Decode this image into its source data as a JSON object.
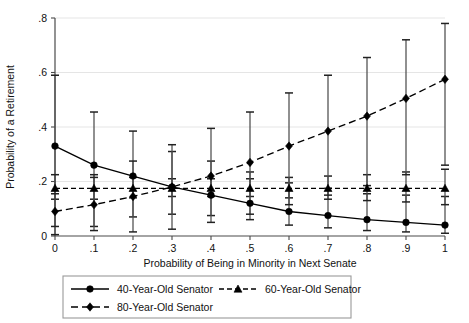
{
  "chart_data": {
    "type": "line",
    "title": "",
    "subtitle": "",
    "xlabel": "Probability of Being in Minority in Next Senate",
    "ylabel": "Probability of a Retirement",
    "x": [
      0,
      0.1,
      0.2,
      0.3,
      0.4,
      0.5,
      0.6,
      0.7,
      0.8,
      0.9,
      1
    ],
    "xtick_labels": [
      "0",
      ".1",
      ".2",
      ".3",
      ".4",
      ".5",
      ".6",
      ".7",
      ".8",
      ".9",
      "1"
    ],
    "ytick_labels": [
      "0",
      ".2",
      ".4",
      ".6",
      ".8"
    ],
    "ytick_values": [
      0,
      0.2,
      0.4,
      0.6,
      0.8
    ],
    "xlim": [
      0,
      1
    ],
    "ylim": [
      0,
      0.8
    ],
    "grid": "horizontal",
    "legend_position": "below-axes",
    "error_bars": "vertical, capped, 95% confidence interval",
    "series": [
      {
        "name": "40-Year-Old Senator",
        "marker": "circle",
        "linestyle": "solid",
        "color": "#000000",
        "values": [
          0.33,
          0.26,
          0.22,
          0.18,
          0.15,
          0.12,
          0.09,
          0.075,
          0.06,
          0.05,
          0.04
        ],
        "err_low": [
          0.005,
          0.035,
          0.07,
          0.08,
          0.075,
          0.06,
          0.04,
          0.03,
          0.02,
          0.015,
          0.01
        ],
        "err_high": [
          0.59,
          0.455,
          0.385,
          0.31,
          0.275,
          0.235,
          0.195,
          0.175,
          0.155,
          0.15,
          0.145
        ]
      },
      {
        "name": "60-Year-Old Senator",
        "marker": "triangle",
        "linestyle": "dashed",
        "color": "#000000",
        "values": [
          0.175,
          0.175,
          0.175,
          0.175,
          0.175,
          0.175,
          0.175,
          0.175,
          0.175,
          0.175,
          0.175
        ],
        "err_low": [
          0.135,
          0.135,
          0.14,
          0.145,
          0.145,
          0.145,
          0.14,
          0.135,
          0.13,
          0.125,
          0.115
        ],
        "err_high": [
          0.225,
          0.225,
          0.215,
          0.21,
          0.21,
          0.21,
          0.215,
          0.22,
          0.225,
          0.235,
          0.245
        ]
      },
      {
        "name": "80-Year-Old Senator",
        "marker": "diamond",
        "linestyle": "dash",
        "color": "#000000",
        "values": [
          0.09,
          0.115,
          0.145,
          0.18,
          0.22,
          0.27,
          0.33,
          0.385,
          0.44,
          0.505,
          0.575
        ],
        "err_low": [
          0.035,
          0.02,
          0.015,
          0.025,
          0.05,
          0.08,
          0.115,
          0.15,
          0.185,
          0.225,
          0.26
        ],
        "err_high": [
          0.155,
          0.215,
          0.275,
          0.335,
          0.395,
          0.455,
          0.525,
          0.59,
          0.655,
          0.72,
          0.78
        ]
      }
    ],
    "legend": [
      {
        "label": "40-Year-Old Senator",
        "marker": "circle",
        "linestyle": "solid"
      },
      {
        "label": "60-Year-Old Senator",
        "marker": "triangle",
        "linestyle": "dashed"
      },
      {
        "label": "80-Year-Old Senator",
        "marker": "diamond",
        "linestyle": "dash"
      }
    ]
  }
}
